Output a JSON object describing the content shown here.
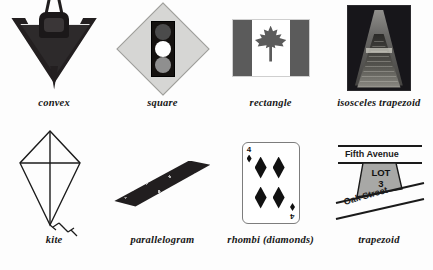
{
  "figure": {
    "background_color": "#fdfdfd",
    "caption_color": "#161616",
    "rows": 2,
    "columns": 4
  },
  "items": [
    {
      "caption": "convex",
      "icon": "convex-craft-photo",
      "description": "Dark V-shaped craft photograph with light outlined convex polygon",
      "colors": {
        "body": "#231f20",
        "outline": "#e8e8e8"
      }
    },
    {
      "caption": "square",
      "icon": "traffic-signal-sign",
      "description": "Diamond-oriented square road sign with vertical traffic signal",
      "colors": {
        "sign": "#d6d6d4",
        "border": "#9d9d99",
        "housing": "#14110f",
        "lit_lamp": "#ffffff"
      }
    },
    {
      "caption": "rectangle",
      "icon": "canadian-flag",
      "description": "Canadian flag with maple leaf, grayscale",
      "colors": {
        "band": "#5b5b5b",
        "field": "#ffffff"
      }
    },
    {
      "caption": "isosceles trapezoid",
      "icon": "perspective-corridor-photo",
      "description": "Dark night photograph of a receding lit corridor forming a trapezoid",
      "colors": {
        "photo": "#17161a",
        "glow": "#9b9a96"
      }
    },
    {
      "caption": "kite",
      "icon": "kite-line-drawing",
      "description": "Line drawing of a kite with crossed diagonals and bowed tail",
      "colors": {
        "stroke": "#1b1b1b"
      }
    },
    {
      "caption": "parallelogram",
      "icon": "parallelogram-photo",
      "description": "Dark slanted textured parallelogram object",
      "colors": {
        "body": "#211e1f",
        "speckle": "#ebebeb"
      }
    },
    {
      "caption": "rhombi (diamonds)",
      "icon": "playing-card-four-of-diamonds",
      "description": "Playing card showing four diamond pips",
      "rank": "4",
      "pip_count": 4,
      "colors": {
        "card": "#ffffff",
        "border": "#7d7d7d",
        "pip": "#111111"
      }
    },
    {
      "caption": "trapezoid",
      "icon": "street-lot-diagram",
      "description": "Corner lot between two streets forming a trapezoid",
      "colors": {
        "lot_fill": "#a8a8a6",
        "stroke": "#1a1a1a"
      }
    }
  ],
  "street_diagram": {
    "top_street": "Fifth Avenue",
    "bottom_street": "Oak Street",
    "lot_label_line1": "LOT",
    "lot_label_line2": "3"
  },
  "playing_card": {
    "rank_top_left": "4",
    "rank_bottom_right": "4"
  }
}
